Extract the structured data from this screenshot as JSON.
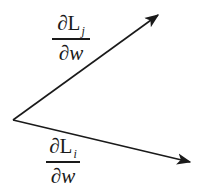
{
  "diagram": {
    "type": "vector-diagram",
    "colors": {
      "stroke": "#1a1a1a",
      "background": "#ffffff"
    },
    "origin": {
      "x": 13,
      "y": 120
    },
    "vectors": [
      {
        "id": "grad-Lj",
        "to": {
          "x": 158,
          "y": 15
        },
        "label": {
          "numerator_symbol": "∂L",
          "subscript": "j",
          "denominator_symbol": "∂",
          "denominator_var": "w"
        }
      },
      {
        "id": "grad-Li",
        "to": {
          "x": 190,
          "y": 162
        },
        "label": {
          "numerator_symbol": "∂L",
          "subscript": "i",
          "denominator_symbol": "∂",
          "denominator_var": "w"
        }
      }
    ]
  }
}
